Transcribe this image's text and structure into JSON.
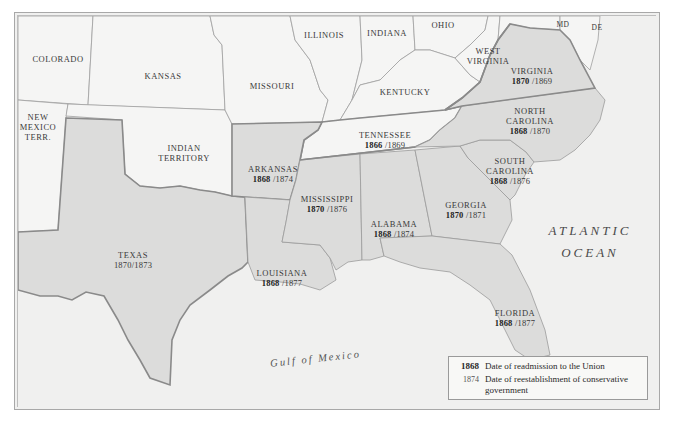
{
  "map": {
    "colors": {
      "confederate_fill": "#dcdcdb",
      "other_fill": "#f4f4f3",
      "water": "#f0f0ef",
      "border_thick": "#8a8a8a",
      "border_thin": "#a0a0a0"
    },
    "other_regions": [
      {
        "id": "colorado",
        "name": "COLORADO"
      },
      {
        "id": "kansas",
        "name": "KANSAS"
      },
      {
        "id": "missouri",
        "name": "MISSOURI"
      },
      {
        "id": "illinois",
        "name": "ILLINOIS"
      },
      {
        "id": "indiana",
        "name": "INDIANA"
      },
      {
        "id": "ohio",
        "name": "OHIO"
      },
      {
        "id": "md",
        "name": "MD"
      },
      {
        "id": "de",
        "name": "DE"
      },
      {
        "id": "west_virginia",
        "name": "WEST VIRGINIA"
      },
      {
        "id": "kentucky",
        "name": "KENTUCKY"
      },
      {
        "id": "new_mexico",
        "name": "NEW MEXICO TERR."
      },
      {
        "id": "indian_territory",
        "name": "INDIAN TERRITORY"
      }
    ],
    "states": [
      {
        "id": "virginia",
        "name": "VIRGINIA",
        "readmission": "1870",
        "conservative": "/1869"
      },
      {
        "id": "north_carolina",
        "name": "NORTH CAROLINA",
        "readmission": "1868",
        "conservative": "/1870"
      },
      {
        "id": "tennessee",
        "name": "TENNESSEE",
        "readmission": "1866",
        "conservative": "/1869"
      },
      {
        "id": "south_carolina",
        "name": "SOUTH CAROLINA",
        "readmission": "1868",
        "conservative": "/1876"
      },
      {
        "id": "arkansas",
        "name": "ARKANSAS",
        "readmission": "1868",
        "conservative": "/1874"
      },
      {
        "id": "mississippi",
        "name": "MISSISSIPPI",
        "readmission": "1870",
        "conservative": "/1876"
      },
      {
        "id": "alabama",
        "name": "ALABAMA",
        "readmission": "1868",
        "conservative": "/1874"
      },
      {
        "id": "georgia",
        "name": "GEORGIA",
        "readmission": "1870",
        "conservative": "/1871"
      },
      {
        "id": "texas",
        "name": "TEXAS",
        "readmission": "1870",
        "conservative": "/1873"
      },
      {
        "id": "louisiana",
        "name": "LOUISIANA",
        "readmission": "1868",
        "conservative": "/1877"
      },
      {
        "id": "florida",
        "name": "FLORIDA",
        "readmission": "1868",
        "conservative": "/1877"
      }
    ],
    "water_labels": {
      "atlantic_line1": "ATLANTIC",
      "atlantic_line2": "OCEAN",
      "gulf": "Gulf of Mexico"
    }
  },
  "legend": {
    "items": [
      {
        "key": "1868",
        "label": "Date of readmission to the Union"
      },
      {
        "key": "1874",
        "label": "Date of reestablishment of conservative government"
      }
    ]
  }
}
